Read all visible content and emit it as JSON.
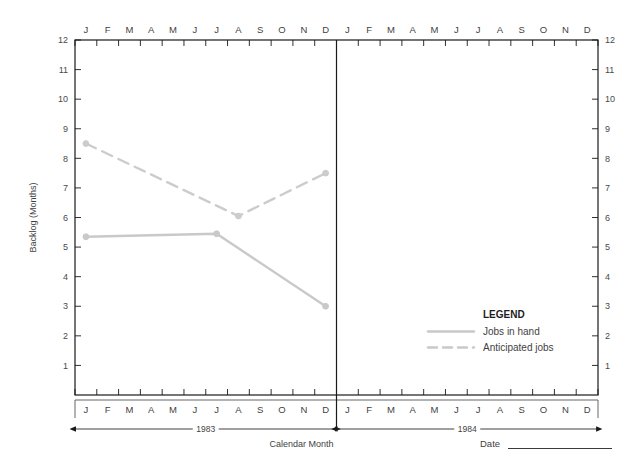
{
  "chart_data": {
    "type": "line",
    "title": "",
    "xlabel": "Calendar Month",
    "ylabel": "Backlog (Months)",
    "ylim": [
      0,
      12
    ],
    "yticks": [
      1,
      2,
      3,
      4,
      5,
      6,
      7,
      8,
      9,
      10,
      11,
      12
    ],
    "grid": false,
    "legend_position": "inside-lower-right",
    "x_categories": [
      "J",
      "F",
      "M",
      "A",
      "M",
      "J",
      "J",
      "A",
      "S",
      "O",
      "N",
      "D",
      "J",
      "F",
      "M",
      "A",
      "M",
      "J",
      "J",
      "A",
      "S",
      "O",
      "N",
      "D"
    ],
    "x_groups": [
      {
        "label": "1983",
        "start_index": 0,
        "end_index": 11
      },
      {
        "label": "1984",
        "start_index": 12,
        "end_index": 23
      }
    ],
    "series": [
      {
        "name": "Jobs in hand",
        "style": "solid",
        "color": "#c9c9c9",
        "points": [
          {
            "x_index": 0,
            "x_label": "J",
            "year": "1983",
            "value": 5.35
          },
          {
            "x_index": 6,
            "x_label": "J",
            "year": "1983",
            "value": 5.45
          },
          {
            "x_index": 11,
            "x_label": "D",
            "year": "1983",
            "value": 3.0
          }
        ]
      },
      {
        "name": "Anticipated jobs",
        "style": "dashed",
        "color": "#cccccc",
        "points": [
          {
            "x_index": 0,
            "x_label": "J",
            "year": "1983",
            "value": 8.5
          },
          {
            "x_index": 7,
            "x_label": "A",
            "year": "1983",
            "value": 6.05
          },
          {
            "x_index": 11,
            "x_label": "D",
            "year": "1983",
            "value": 7.5
          }
        ]
      }
    ]
  },
  "axes": {
    "left": {
      "title": "Backlog (Months)",
      "ticks": [
        "12",
        "11",
        "10",
        "9",
        "8",
        "7",
        "6",
        "5",
        "4",
        "3",
        "2",
        "1"
      ]
    },
    "right": {
      "ticks": [
        "12",
        "11",
        "10",
        "9",
        "8",
        "7",
        "6",
        "5",
        "4",
        "3",
        "2",
        "1"
      ]
    },
    "top": {
      "months": [
        "J",
        "F",
        "M",
        "A",
        "M",
        "J",
        "J",
        "A",
        "S",
        "O",
        "N",
        "D",
        "J",
        "F",
        "M",
        "A",
        "M",
        "J",
        "J",
        "A",
        "S",
        "O",
        "N",
        "D"
      ]
    },
    "bottom": {
      "months": [
        "J",
        "F",
        "M",
        "A",
        "M",
        "J",
        "J",
        "A",
        "S",
        "O",
        "N",
        "D",
        "J",
        "F",
        "M",
        "A",
        "M",
        "J",
        "J",
        "A",
        "S",
        "O",
        "N",
        "D"
      ],
      "year_left": "1983",
      "year_right": "1984",
      "title": "Calendar Month"
    }
  },
  "legend": {
    "title": "LEGEND",
    "items": [
      {
        "label": "Jobs in hand",
        "style": "solid"
      },
      {
        "label": "Anticipated jobs",
        "style": "dashed"
      }
    ]
  },
  "footer": {
    "date_label": "Date",
    "date_value": ""
  },
  "colors": {
    "series_line": "#c9c9c9",
    "axis": "#1a1a1a",
    "text": "#3f3f3f"
  }
}
